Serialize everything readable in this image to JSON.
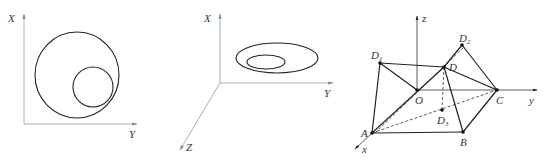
{
  "panels": [
    {
      "id": "panel-1",
      "axes": {
        "vertical": "X",
        "horizontal": "Y"
      },
      "shapes": [
        "large-circle",
        "small-circle-inside-tangent"
      ]
    },
    {
      "id": "panel-2",
      "axes": {
        "vertical": "X",
        "horizontal": "Y",
        "depth": "Z"
      },
      "shapes": [
        "outer-ellipse",
        "inner-ellipse"
      ]
    },
    {
      "id": "panel-3",
      "axes": {
        "z": "z",
        "y": "y",
        "x": "x"
      },
      "points": {
        "O": "O",
        "A": "A",
        "B": "B",
        "C": "C",
        "D": "D",
        "D1": "D",
        "D1_sub": "1",
        "D2": "D",
        "D2_sub": "2",
        "D3": "D",
        "D3_sub": "3"
      }
    }
  ]
}
